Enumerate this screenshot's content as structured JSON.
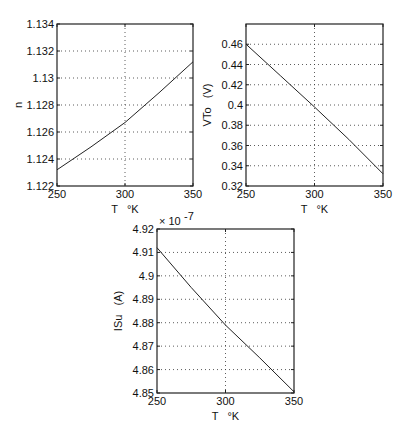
{
  "chart_data": [
    {
      "type": "line",
      "title": "",
      "xlabel": "T   °K",
      "ylabel": "n",
      "xlim": [
        250,
        350
      ],
      "ylim": [
        1.122,
        1.134
      ],
      "xticks": [
        250,
        300,
        350
      ],
      "xtick_labels": [
        "250",
        "300",
        "350"
      ],
      "yticks": [
        1.122,
        1.124,
        1.126,
        1.128,
        1.13,
        1.132,
        1.134
      ],
      "ytick_labels": [
        "1.122",
        "1.124",
        "1.126",
        "1.128",
        "1.13",
        "1.132",
        "1.134"
      ],
      "grid": true,
      "x": [
        250,
        275,
        300,
        325,
        350
      ],
      "values": [
        1.1232,
        1.1249,
        1.1267,
        1.1289,
        1.1312
      ],
      "frame": {
        "left": 57,
        "top": 24,
        "right": 193,
        "bottom": 186
      }
    },
    {
      "type": "line",
      "title": "",
      "xlabel": "T   °K",
      "ylabel": "VTo   (V)",
      "xlim": [
        250,
        350
      ],
      "ylim": [
        0.32,
        0.48
      ],
      "xticks": [
        250,
        300,
        350
      ],
      "xtick_labels": [
        "250",
        "300",
        "350"
      ],
      "yticks": [
        0.32,
        0.34,
        0.36,
        0.38,
        0.4,
        0.42,
        0.44,
        0.46
      ],
      "ytick_labels": [
        "0.32",
        "0.34",
        "0.36",
        "0.38",
        "0.4",
        "0.42",
        "0.44",
        "0.46"
      ],
      "grid": true,
      "x": [
        250,
        275,
        300,
        325,
        350
      ],
      "values": [
        0.46,
        0.429,
        0.398,
        0.366,
        0.332
      ],
      "frame": {
        "left": 246,
        "top": 24,
        "right": 383,
        "bottom": 186
      }
    },
    {
      "type": "line",
      "title": "",
      "xlabel": "T   °K",
      "ylabel": "ISu   (A)",
      "exponent_label": "× 10",
      "exponent_power": "-7",
      "xlim": [
        250,
        350
      ],
      "ylim": [
        4.85,
        4.92
      ],
      "xticks": [
        250,
        300,
        350
      ],
      "xtick_labels": [
        "250",
        "300",
        "350"
      ],
      "yticks": [
        4.85,
        4.86,
        4.87,
        4.88,
        4.89,
        4.9,
        4.91,
        4.92
      ],
      "ytick_labels": [
        "4.85",
        "4.86",
        "4.87",
        "4.88",
        "4.89",
        "4.9",
        "4.91",
        "4.92"
      ],
      "grid": true,
      "x": [
        250,
        275,
        300,
        325,
        350
      ],
      "values": [
        4.912,
        4.895,
        4.879,
        4.865,
        4.8505
      ],
      "frame": {
        "left": 157,
        "top": 229,
        "right": 294,
        "bottom": 393
      }
    }
  ]
}
